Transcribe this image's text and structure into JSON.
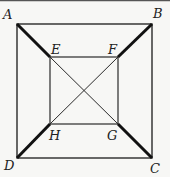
{
  "diagram": {
    "title": "",
    "points": {
      "A": {
        "label": "A",
        "x": 17,
        "y": 24
      },
      "B": {
        "label": "B",
        "x": 152,
        "y": 24
      },
      "C": {
        "label": "C",
        "x": 152,
        "y": 158
      },
      "D": {
        "label": "D",
        "x": 17,
        "y": 158
      },
      "E": {
        "label": "E",
        "x": 50,
        "y": 57
      },
      "F": {
        "label": "F",
        "x": 118,
        "y": 57
      },
      "G": {
        "label": "G",
        "x": 118,
        "y": 124
      },
      "H": {
        "label": "H",
        "x": 50,
        "y": 124
      }
    },
    "outer_square": [
      "A",
      "B",
      "C",
      "D"
    ],
    "inner_square": [
      "E",
      "F",
      "G",
      "H"
    ],
    "thick_segments": [
      [
        "A",
        "E"
      ],
      [
        "B",
        "F"
      ],
      [
        "C",
        "G"
      ],
      [
        "D",
        "H"
      ]
    ],
    "thin_diagonals": [
      [
        "E",
        "G"
      ],
      [
        "F",
        "H"
      ]
    ],
    "colors": {
      "line": "#2a2a2a",
      "thick_line": "#111111",
      "background": "#f7f7f5",
      "frame": "#555555"
    }
  }
}
